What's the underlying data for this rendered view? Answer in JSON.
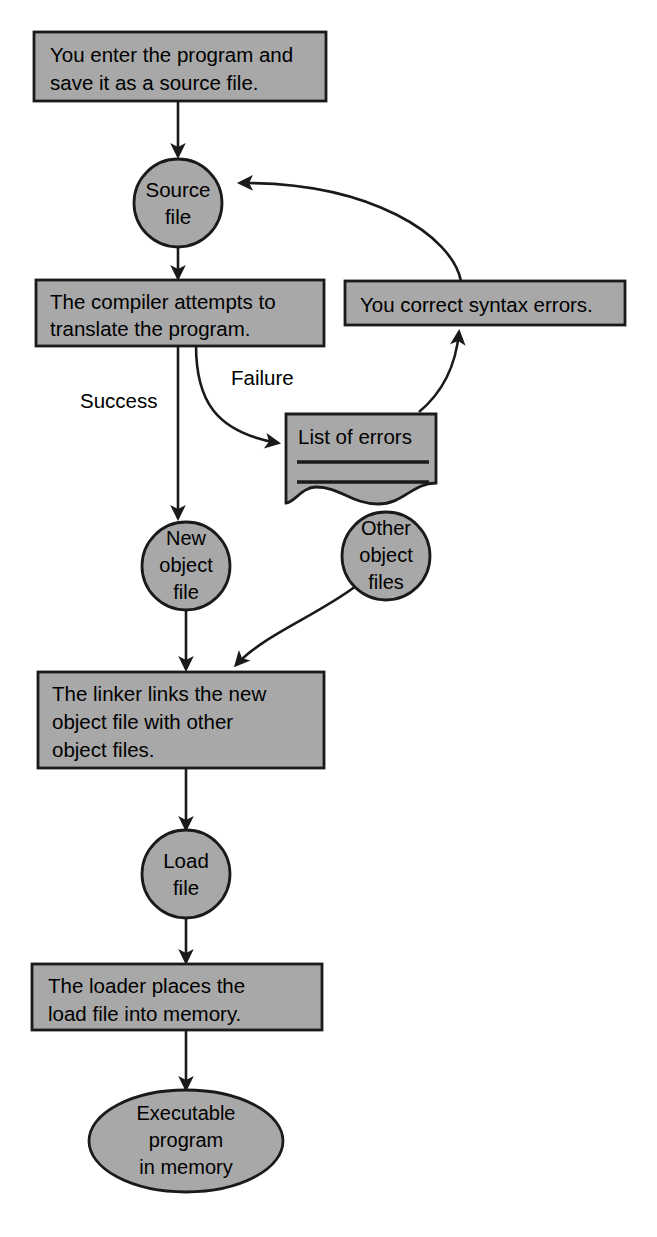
{
  "diagram": {
    "colors": {
      "shape_fill": "#a8a8a8",
      "shape_stroke": "#1a1a1a",
      "background": "#ffffff",
      "text": "#000000"
    },
    "nodes": {
      "enter_program": {
        "shape": "rectangle",
        "lines": [
          "You enter the program and",
          "save it as a source file."
        ]
      },
      "source_file": {
        "shape": "circle",
        "lines": [
          "Source",
          "file"
        ]
      },
      "compiler": {
        "shape": "rectangle",
        "lines": [
          "The compiler attempts to",
          "translate the program."
        ]
      },
      "correct_errors": {
        "shape": "rectangle",
        "lines": [
          "You correct syntax errors."
        ]
      },
      "list_of_errors": {
        "shape": "document",
        "lines": [
          "List of errors"
        ]
      },
      "new_object_file": {
        "shape": "circle",
        "lines": [
          "New",
          "object",
          "file"
        ]
      },
      "other_object_files": {
        "shape": "circle",
        "lines": [
          "Other",
          "object",
          "files"
        ]
      },
      "linker": {
        "shape": "rectangle",
        "lines": [
          "The linker links the new",
          "object file with other",
          "object files."
        ]
      },
      "load_file": {
        "shape": "circle",
        "lines": [
          "Load",
          "file"
        ]
      },
      "loader": {
        "shape": "rectangle",
        "lines": [
          "The loader places the",
          "load file into memory."
        ]
      },
      "executable_program": {
        "shape": "ellipse",
        "lines": [
          "Executable",
          "program",
          "in memory"
        ]
      }
    },
    "edge_labels": {
      "success": "Success",
      "failure": "Failure"
    }
  }
}
